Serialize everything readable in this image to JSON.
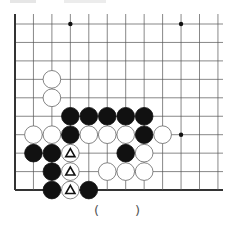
{
  "title_partial": "",
  "board": {
    "origin_x": 15,
    "origin_y": 24,
    "spacing": 18.45,
    "cols": 12,
    "rows": 10,
    "right_extent": 223,
    "edges": {
      "left": true,
      "bottom": true,
      "top": false,
      "right": false
    },
    "line_color": "#555555",
    "edge_color": "#333333",
    "hoshi": [
      [
        3,
        0
      ],
      [
        9,
        0
      ],
      [
        9,
        6
      ]
    ],
    "stones": [
      {
        "c": 2,
        "r": 3,
        "color": "white"
      },
      {
        "c": 2,
        "r": 4,
        "color": "white"
      },
      {
        "c": 3,
        "r": 5,
        "color": "black"
      },
      {
        "c": 4,
        "r": 5,
        "color": "black"
      },
      {
        "c": 5,
        "r": 5,
        "color": "black"
      },
      {
        "c": 6,
        "r": 5,
        "color": "black"
      },
      {
        "c": 7,
        "r": 5,
        "color": "black"
      },
      {
        "c": 1,
        "r": 6,
        "color": "white"
      },
      {
        "c": 2,
        "r": 6,
        "color": "white"
      },
      {
        "c": 3,
        "r": 6,
        "color": "black"
      },
      {
        "c": 4,
        "r": 6,
        "color": "white"
      },
      {
        "c": 5,
        "r": 6,
        "color": "white"
      },
      {
        "c": 6,
        "r": 6,
        "color": "white"
      },
      {
        "c": 7,
        "r": 6,
        "color": "black"
      },
      {
        "c": 8,
        "r": 6,
        "color": "white"
      },
      {
        "c": 1,
        "r": 7,
        "color": "black"
      },
      {
        "c": 2,
        "r": 7,
        "color": "black"
      },
      {
        "c": 3,
        "r": 7,
        "color": "white",
        "mark": "triangle"
      },
      {
        "c": 6,
        "r": 7,
        "color": "black"
      },
      {
        "c": 7,
        "r": 7,
        "color": "white"
      },
      {
        "c": 2,
        "r": 8,
        "color": "black"
      },
      {
        "c": 3,
        "r": 8,
        "color": "white",
        "mark": "triangle"
      },
      {
        "c": 5,
        "r": 8,
        "color": "white"
      },
      {
        "c": 6,
        "r": 8,
        "color": "white"
      },
      {
        "c": 7,
        "r": 8,
        "color": "white"
      },
      {
        "c": 2,
        "r": 9,
        "color": "black"
      },
      {
        "c": 3,
        "r": 9,
        "color": "white",
        "mark": "triangle"
      },
      {
        "c": 4,
        "r": 9,
        "color": "black"
      }
    ]
  },
  "answer": {
    "open": "(",
    "close": ")"
  }
}
